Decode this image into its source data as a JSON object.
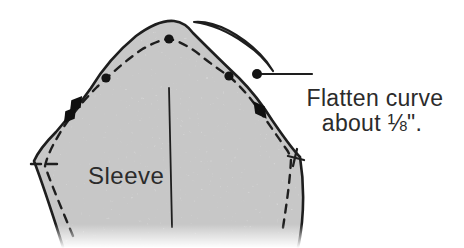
{
  "figure": {
    "piece_label": "Sleeve",
    "callout": {
      "line1": "Flatten curve",
      "line2": "about ⅛\"."
    },
    "colors": {
      "ink": "#1e1e1e",
      "paper_fill": "#ededed",
      "background": "#ffffff",
      "text": "#2b2b2b"
    },
    "markers": {
      "seam_dots": 3,
      "callout_dot": 1,
      "notch_icons": [
        "double-notch-icon",
        "single-notch-icon"
      ],
      "corner_mark": "corner-cross-icon"
    }
  }
}
